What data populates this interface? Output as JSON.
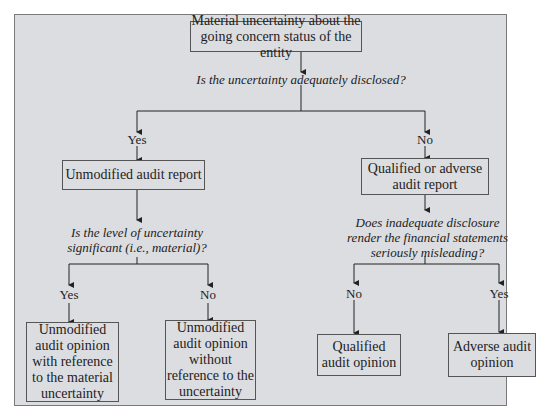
{
  "diagram": {
    "root": {
      "text": "Material uncertainty about the going concern status of the entity"
    },
    "question1": {
      "text": "Is the uncertainty adequately disclosed?"
    },
    "branch_yes": {
      "label": "Yes",
      "result": {
        "text": "Unmodified audit report"
      },
      "question": {
        "text": "Is the level of uncertainty significant (i.e., material)?"
      },
      "yes": {
        "label": "Yes",
        "outcome": "Unmodified audit opinion with reference to the material uncertainty"
      },
      "no": {
        "label": "No",
        "outcome": "Unmodified audit opinion without reference to the uncertainty"
      }
    },
    "branch_no": {
      "label": "No",
      "result": {
        "text": "Qualified or adverse audit report"
      },
      "question": {
        "text": "Does inadequate disclosure render the financial statements seriously misleading?"
      },
      "no": {
        "label": "No",
        "outcome": "Qualified audit opinion"
      },
      "yes": {
        "label": "Yes",
        "outcome": "Adverse audit opinion"
      }
    }
  },
  "colors": {
    "panel": "#dcdde0",
    "border": "#555555",
    "text": "#222222"
  }
}
